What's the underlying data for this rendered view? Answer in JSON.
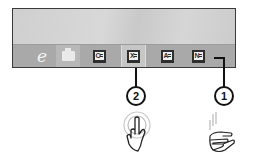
{
  "screen": {
    "taskbar": {
      "items": [
        {
          "name": "Internet Explorer",
          "icon": "internet-explorer-icon",
          "glyph": "e",
          "active": false
        },
        {
          "name": "File Explorer",
          "icon": "file-explorer-icon",
          "glyph": "",
          "active": false
        },
        {
          "name": "Outlook",
          "icon": "outlook-icon",
          "glyph": "O",
          "active": false
        },
        {
          "name": "Excel",
          "icon": "excel-icon",
          "glyph": "X",
          "active": true
        },
        {
          "name": "Access",
          "icon": "access-icon",
          "glyph": "A",
          "active": false
        },
        {
          "name": "OneNote",
          "icon": "onenote-icon",
          "glyph": "N",
          "active": false
        }
      ]
    }
  },
  "callouts": [
    {
      "number": "2",
      "target": "Excel",
      "gesture": "tap"
    },
    {
      "number": "1",
      "target": "OneNote",
      "gesture": "swipe"
    }
  ],
  "colors": {
    "frame_border": "#3a3a3a",
    "taskbar": "#a9a9a9",
    "desktop": "#d2d2d2",
    "icon_dark": "#2e2e2e",
    "callout": "#111111"
  }
}
